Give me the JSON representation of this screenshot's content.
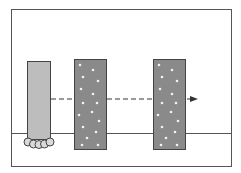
{
  "diagram": {
    "colors": {
      "background": "#ffffff",
      "frame": "#555555",
      "column_fill": "#bdbdbd",
      "panel_fill": "#8a8a8a",
      "panel_dots": "#f2f2f2",
      "ground_line": "#555555",
      "arrow": "#333333",
      "feet_fill": "#d9d9d9"
    },
    "elements": {
      "frame": {
        "x": 11,
        "y": 9,
        "w": 220,
        "h": 157
      },
      "ground_line_y": 133,
      "column": {
        "x": 27,
        "y": 61,
        "w": 23,
        "h": 78
      },
      "feet": {
        "count": 5,
        "cy": 142,
        "r": 4
      },
      "panels": [
        {
          "label": "panel-1",
          "x": 74,
          "y": 59,
          "w": 32,
          "h": 90
        },
        {
          "label": "panel-2",
          "x": 153,
          "y": 59,
          "w": 32,
          "h": 90
        }
      ],
      "arrow": {
        "x1": 50,
        "x2": 198,
        "y": 99,
        "style": "dashed",
        "direction": "right"
      }
    }
  }
}
